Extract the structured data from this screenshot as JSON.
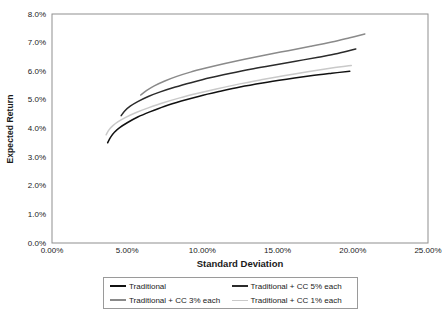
{
  "chart_data": {
    "type": "line",
    "title": "",
    "xlabel": "Standard Deviation",
    "ylabel": "Expected Return",
    "xlim": [
      0,
      25
    ],
    "ylim": [
      0,
      8
    ],
    "grid": false,
    "legend_position": "bottom",
    "xticks": [
      "0.00%",
      "5.00%",
      "10.00%",
      "15.00%",
      "20.00%",
      "25.00%"
    ],
    "xtick_values": [
      0,
      5,
      10,
      15,
      20,
      25
    ],
    "yticks": [
      "0.0%",
      "1.0%",
      "2.0%",
      "3.0%",
      "4.0%",
      "5.0%",
      "6.0%",
      "7.0%",
      "8.0%"
    ],
    "ytick_values": [
      0,
      1,
      2,
      3,
      4,
      5,
      6,
      7,
      8
    ],
    "series": [
      {
        "name": "Traditional",
        "color": "#111111",
        "width": 1.5,
        "points": [
          [
            3.7,
            3.5
          ],
          [
            3.9,
            3.7
          ],
          [
            4.15,
            3.87
          ],
          [
            4.5,
            4.03
          ],
          [
            5.0,
            4.2
          ],
          [
            5.7,
            4.4
          ],
          [
            6.5,
            4.58
          ],
          [
            7.5,
            4.78
          ],
          [
            8.6,
            4.96
          ],
          [
            9.8,
            5.13
          ],
          [
            11.1,
            5.29
          ],
          [
            12.5,
            5.45
          ],
          [
            14.0,
            5.59
          ],
          [
            15.6,
            5.72
          ],
          [
            17.2,
            5.84
          ],
          [
            18.6,
            5.93
          ],
          [
            19.8,
            6.0
          ]
        ]
      },
      {
        "name": "Traditional + CC 1% each",
        "color": "#c9c9c9",
        "width": 1.5,
        "points": [
          [
            3.6,
            3.78
          ],
          [
            3.8,
            3.96
          ],
          [
            4.05,
            4.1
          ],
          [
            4.4,
            4.24
          ],
          [
            4.9,
            4.39
          ],
          [
            5.6,
            4.56
          ],
          [
            6.4,
            4.72
          ],
          [
            7.4,
            4.9
          ],
          [
            8.5,
            5.07
          ],
          [
            9.7,
            5.23
          ],
          [
            11.0,
            5.39
          ],
          [
            12.4,
            5.55
          ],
          [
            13.9,
            5.7
          ],
          [
            15.5,
            5.85
          ],
          [
            17.1,
            5.99
          ],
          [
            18.6,
            6.11
          ],
          [
            19.9,
            6.2
          ]
        ]
      },
      {
        "name": "Traditional + CC 5% each",
        "color": "#2b2b2b",
        "width": 1.5,
        "points": [
          [
            4.6,
            4.45
          ],
          [
            4.85,
            4.62
          ],
          [
            5.2,
            4.78
          ],
          [
            5.7,
            4.94
          ],
          [
            6.4,
            5.12
          ],
          [
            7.2,
            5.28
          ],
          [
            8.2,
            5.45
          ],
          [
            9.3,
            5.61
          ],
          [
            10.5,
            5.77
          ],
          [
            11.8,
            5.92
          ],
          [
            13.2,
            6.07
          ],
          [
            14.7,
            6.21
          ],
          [
            16.2,
            6.35
          ],
          [
            17.7,
            6.49
          ],
          [
            19.0,
            6.62
          ],
          [
            20.2,
            6.78
          ]
        ]
      },
      {
        "name": "Traditional + CC 3% each",
        "color": "#8a8a8a",
        "width": 1.5,
        "points": [
          [
            5.9,
            5.17
          ],
          [
            6.3,
            5.33
          ],
          [
            6.8,
            5.49
          ],
          [
            7.5,
            5.66
          ],
          [
            8.3,
            5.82
          ],
          [
            9.2,
            5.97
          ],
          [
            10.3,
            6.12
          ],
          [
            11.5,
            6.27
          ],
          [
            12.8,
            6.42
          ],
          [
            14.2,
            6.57
          ],
          [
            15.7,
            6.72
          ],
          [
            17.2,
            6.87
          ],
          [
            18.6,
            7.02
          ],
          [
            19.8,
            7.17
          ],
          [
            20.8,
            7.3
          ]
        ]
      }
    ],
    "legend_entries": [
      {
        "label": "Traditional",
        "color": "#111111"
      },
      {
        "label": "Traditional + CC 5% each",
        "color": "#2b2b2b"
      },
      {
        "label": "Traditional + CC 3% each",
        "color": "#8a8a8a"
      },
      {
        "label": "Traditional + CC 1% each",
        "color": "#c9c9c9"
      }
    ]
  },
  "axis_style": {
    "border_color": "#8f8f8f",
    "background": "#ffffff"
  }
}
